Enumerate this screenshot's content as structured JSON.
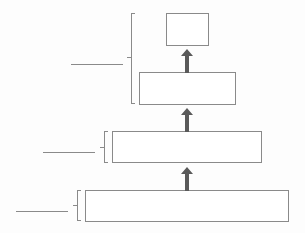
{
  "diagram": {
    "type": "hierarchy-pyramid-blank",
    "levels": [
      {
        "id": "level-1",
        "label": "",
        "blank_label": ""
      },
      {
        "id": "level-2",
        "label": "",
        "blank_label": ""
      },
      {
        "id": "level-3",
        "label": "",
        "blank_label": ""
      },
      {
        "id": "level-4",
        "label": "",
        "blank_label": ""
      }
    ],
    "groups": [
      {
        "id": "group-top",
        "spans": [
          "level-1",
          "level-2"
        ],
        "blank_label": ""
      },
      {
        "id": "group-middle",
        "spans": [
          "level-3"
        ],
        "blank_label": ""
      },
      {
        "id": "group-bottom",
        "spans": [
          "level-4"
        ],
        "blank_label": ""
      }
    ],
    "arrows": [
      {
        "from": "level-4",
        "to": "level-3"
      },
      {
        "from": "level-3",
        "to": "level-2"
      },
      {
        "from": "level-2",
        "to": "level-1"
      }
    ],
    "colors": {
      "stroke": "#8a8a8a",
      "arrow": "#5a5a5a",
      "background": "#fdfdfd"
    }
  }
}
